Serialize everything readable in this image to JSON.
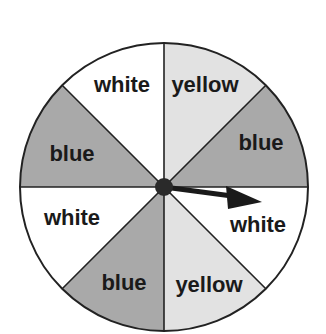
{
  "spinner": {
    "center": [
      164,
      187
    ],
    "radius": 144,
    "colors": {
      "blue": "#a9a9a9",
      "yellow": "#e2e2e2",
      "white": "#ffffff",
      "outline": "#222222"
    },
    "sections": [
      {
        "label": "yellow",
        "color": "yellow"
      },
      {
        "label": "blue",
        "color": "blue"
      },
      {
        "label": "white",
        "color": "white"
      },
      {
        "label": "yellow",
        "color": "yellow"
      },
      {
        "label": "blue",
        "color": "blue"
      },
      {
        "label": "white",
        "color": "white"
      },
      {
        "label": "blue",
        "color": "blue"
      },
      {
        "label": "white",
        "color": "white"
      }
    ],
    "arrow": {
      "pointing_to": "white"
    }
  }
}
